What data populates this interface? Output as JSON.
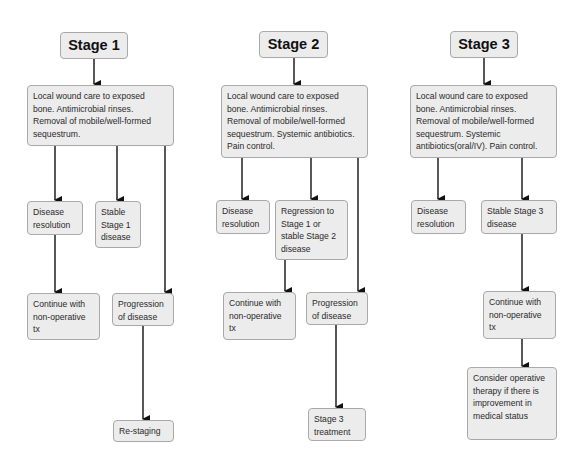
{
  "stages": [
    {
      "title": "Stage 1",
      "treatment": "Local wound care to exposed bone. Antimicrobial rinses. Removal of mobile/well-formed sequestrum.",
      "outcomes": {
        "resolution": "Disease resolution",
        "stable": "Stable Stage 1 disease",
        "continue": "Continue with non-operative tx",
        "progression": "Progression of disease",
        "next": "Re-staging"
      }
    },
    {
      "title": "Stage 2",
      "treatment": "Local wound care to exposed bone. Antimicrobial rinses. Removal of mobile/well-formed sequestrum. Systemic antibiotics. Pain control.",
      "outcomes": {
        "resolution": "Disease resolution",
        "stable": "Regression to Stage 1 or stable Stage 2 disease",
        "continue": "Continue with non-operative tx",
        "progression": "Progression of disease",
        "next": "Stage 3 treatment"
      }
    },
    {
      "title": "Stage 3",
      "treatment": "Local wound care to exposed bone. Antimicrobial rinses. Removal of mobile/well-formed sequestrum. Systemic antibiotics(oral/IV). Pain control.",
      "outcomes": {
        "resolution": "Disease resolution",
        "stable": "Stable Stage 3 disease",
        "continue": "Continue with non-operative tx",
        "next": "Consider operative therapy if there is improvement in medical status"
      }
    }
  ],
  "colors": {
    "box_fill": "#ececec",
    "box_border": "#a9a9a9",
    "arrow": "#111111"
  }
}
